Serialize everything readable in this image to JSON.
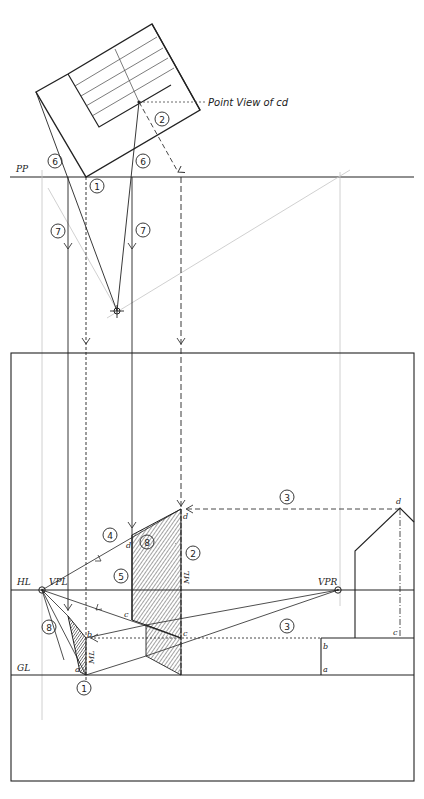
{
  "diagram": {
    "colors": {
      "ink": "#222222",
      "construction": "#bbbbbb",
      "hatch": "#333333",
      "paper": "#ffffff"
    }
  },
  "labels": {
    "pp": "PP",
    "hl": "HL",
    "gl": "GL",
    "vpl": "VPL",
    "vpr": "VPR",
    "ml": "ML",
    "point_view": "Point View of cd",
    "a": "a",
    "b": "b",
    "c": "c",
    "d": "d"
  },
  "steps": {
    "s1_plan": "1",
    "s1_ground": "1",
    "s2_plan": "2",
    "s2_elev": "2",
    "s3_top": "3",
    "s3_bottom": "3",
    "s4": "4",
    "s5": "5",
    "s6_left": "6",
    "s6_right": "6",
    "s7_left": "7",
    "s7_right": "7",
    "s8_upper": "8",
    "s8_lower": "8"
  }
}
